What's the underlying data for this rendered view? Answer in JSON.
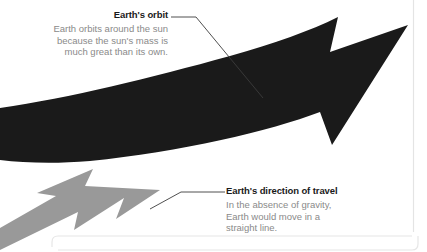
{
  "canvas": {
    "width": 427,
    "height": 252,
    "background": "#ffffff"
  },
  "diagram": {
    "title_semantic": "earth-orbit-vs-straight-line-travel",
    "arrows": [
      {
        "name": "earth-orbit-arrow",
        "color": "#1a1a1a",
        "description": "Large black curved arrow sweeping from lower-left up to the right with a notched arrowhead"
      },
      {
        "name": "direction-of-travel-arrow",
        "color": "#999999",
        "description": "Gray straight arrow pointing down-left with a barbed arrowhead"
      }
    ],
    "frame": {
      "name": "rounded-panel-border",
      "color": "#e2e2e2"
    },
    "right_rule": {
      "name": "right-vertical-rule",
      "color": "#e2e2e2"
    }
  },
  "callouts": [
    {
      "id": "earths-orbit",
      "title": "Earth's orbit",
      "body_lines": [
        "Earth orbits around the sun",
        "because the sun's mass is",
        "much great than its own."
      ],
      "title_color": "#1a1a1a",
      "body_color": "#8a8a8a",
      "leader_color": "#4a4a4a"
    },
    {
      "id": "earths-direction-of-travel",
      "title": "Earth's direction of travel",
      "body_lines": [
        "In the absence of gravity,",
        "Earth would move in a",
        "straight line."
      ],
      "title_color": "#1a1a1a",
      "body_color": "#8a8a8a",
      "leader_color": "#4a4a4a"
    }
  ]
}
